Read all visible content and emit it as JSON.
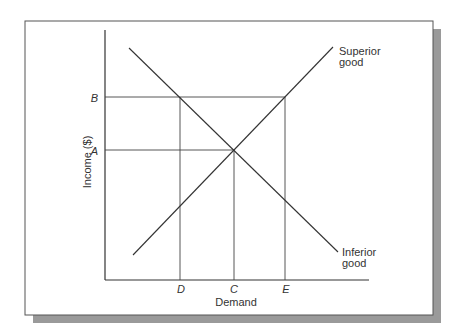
{
  "diagram": {
    "y_axis_label": "Income ($)",
    "x_axis_label": "Demand",
    "y_ticks": [
      {
        "label": "B"
      },
      {
        "label": "A"
      }
    ],
    "x_ticks": [
      {
        "label": "D"
      },
      {
        "label": "C"
      },
      {
        "label": "E"
      }
    ],
    "curves": [
      {
        "label_line1": "Superior",
        "label_line2": "good",
        "direction": "upward"
      },
      {
        "label_line1": "Inferior",
        "label_line2": "good",
        "direction": "downward"
      }
    ],
    "colors": {
      "line": "#333333",
      "shadow": "#999999",
      "frame": "#555555"
    }
  }
}
